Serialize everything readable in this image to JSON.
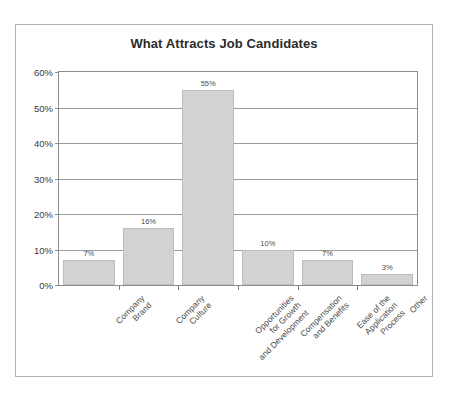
{
  "chart_data": {
    "type": "bar",
    "title": "What Attracts Job Candidates",
    "xlabel": "",
    "ylabel": "",
    "ylim": [
      0,
      60
    ],
    "ytick_labels": [
      "0%",
      "10%",
      "20%",
      "30%",
      "40%",
      "50%",
      "60%"
    ],
    "ytick_values": [
      0,
      10,
      20,
      30,
      40,
      50,
      60
    ],
    "grid": true,
    "legend": "none",
    "categories": [
      "Company Brand",
      "Company Culture",
      "Opportunities for Growth and Development",
      "Compensation and Benefits",
      "Ease of the Application Process",
      "Other"
    ],
    "category_lines": [
      [
        "Company",
        "Brand"
      ],
      [
        "Company",
        "Culture"
      ],
      [
        "Opportunities",
        "for Growth",
        "and Development"
      ],
      [
        "Compensation",
        "and Benefits"
      ],
      [
        "Ease of the",
        "Application",
        "Process"
      ],
      [
        "Other"
      ]
    ],
    "values": [
      7,
      16,
      55,
      10,
      7,
      3
    ],
    "data_labels": [
      "7%",
      "16%",
      "55%",
      "10%",
      "7%",
      "3%"
    ],
    "colors": {
      "bar_fill": "#d2d2d2",
      "bar_border": "#bdbdbd",
      "gridline": "#9a9a9a",
      "axis": "#8c8c8c",
      "title_text": "#2b2b2b",
      "tick_text": "#3a3a3a",
      "label_text": "#4d4d4d",
      "card_border": "#b0b0b0",
      "background": "#ffffff"
    }
  }
}
